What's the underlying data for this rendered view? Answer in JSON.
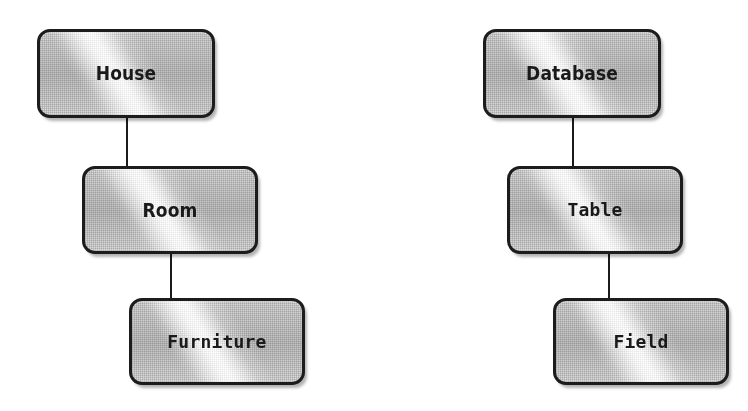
{
  "diagram": {
    "type": "hierarchy-analogy",
    "canvas": {
      "width": 748,
      "height": 411,
      "background": "#ffffff"
    },
    "style": {
      "node_fill": "#c9c9c9",
      "node_border": "#1c1c1c",
      "connector_color": "#1b1b1b",
      "label_color": "#1a1a1a",
      "node_corner_radius": 13,
      "node_border_width": 3,
      "texture": "halftone-dither-with-diagonal-sheen"
    },
    "groups": [
      {
        "id": "physical-analogy",
        "name": "house-hierarchy",
        "nodes": [
          {
            "id": "house",
            "label": "House",
            "level": 1,
            "font": "sans-bold-condensed",
            "x": 37,
            "y": 29,
            "width": 178,
            "height": 89
          },
          {
            "id": "room",
            "label": "Room",
            "level": 2,
            "font": "sans-bold-condensed",
            "x": 82,
            "y": 166,
            "width": 176,
            "height": 88
          },
          {
            "id": "furniture",
            "label": "Furniture",
            "level": 3,
            "font": "mono-bold",
            "x": 129,
            "y": 298,
            "width": 176,
            "height": 87
          }
        ],
        "connectors": [
          {
            "id": "house-room",
            "from": "house",
            "to": "room",
            "x": 126,
            "y": 117,
            "width": 2,
            "height": 50
          },
          {
            "id": "room-furniture",
            "from": "room",
            "to": "furniture",
            "x": 170,
            "y": 253,
            "width": 2,
            "height": 46
          }
        ]
      },
      {
        "id": "database-analogy",
        "name": "database-hierarchy",
        "nodes": [
          {
            "id": "database",
            "label": "Database",
            "level": 1,
            "font": "sans-bold-condensed",
            "x": 483,
            "y": 29,
            "width": 178,
            "height": 89
          },
          {
            "id": "table",
            "label": "Table",
            "level": 2,
            "font": "mono-bold",
            "x": 507,
            "y": 166,
            "width": 176,
            "height": 88
          },
          {
            "id": "field",
            "label": "Field",
            "level": 3,
            "font": "mono-bold",
            "x": 553,
            "y": 298,
            "width": 176,
            "height": 87
          }
        ],
        "connectors": [
          {
            "id": "database-table",
            "from": "database",
            "to": "table",
            "x": 572,
            "y": 117,
            "width": 2,
            "height": 50
          },
          {
            "id": "table-field",
            "from": "table",
            "to": "field",
            "x": 608,
            "y": 253,
            "width": 2,
            "height": 46
          }
        ]
      }
    ]
  }
}
